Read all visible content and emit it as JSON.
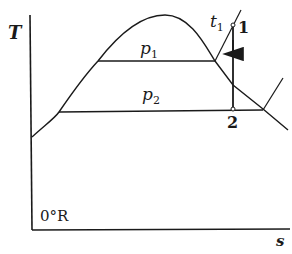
{
  "diagram": {
    "type": "temperature-entropy diagram",
    "axes": {
      "y_label": "T",
      "x_label": "s",
      "origin_label": "0°R"
    },
    "isobars": [
      {
        "name": "p1",
        "symbol": "p",
        "subscript": "1"
      },
      {
        "name": "p2",
        "symbol": "p",
        "subscript": "2"
      }
    ],
    "temperature_label": {
      "symbol": "t",
      "subscript": "1"
    },
    "points": [
      {
        "label": "1"
      },
      {
        "label": "2"
      }
    ],
    "process": "isentropic expansion from point 1 to point 2",
    "colors": {
      "ink": "#1a1a1a",
      "background": "#ffffff"
    }
  }
}
